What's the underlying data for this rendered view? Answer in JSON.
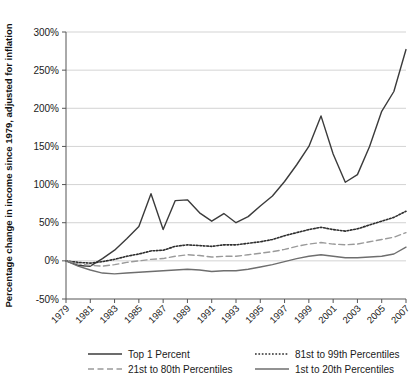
{
  "chart_data": {
    "type": "line",
    "title": "",
    "xlabel": "",
    "ylabel": "Percentage change in income since 1979, adjusted for inflation",
    "grid": true,
    "legend_position": "bottom",
    "ylim": [
      -50,
      300
    ],
    "yticks": [
      "-50%",
      "0%",
      "50%",
      "100%",
      "150%",
      "200%",
      "250%",
      "300%"
    ],
    "ytick_values": [
      -50,
      0,
      50,
      100,
      150,
      200,
      250,
      300
    ],
    "xlim": [
      1979,
      2007
    ],
    "xticks": [
      "1979",
      "1981",
      "1983",
      "1985",
      "1987",
      "1989",
      "1991",
      "1993",
      "1995",
      "1997",
      "1999",
      "2001",
      "2003",
      "2005",
      "2007"
    ],
    "x": [
      1979,
      1980,
      1981,
      1982,
      1983,
      1984,
      1985,
      1986,
      1987,
      1988,
      1989,
      1990,
      1991,
      1992,
      1993,
      1994,
      1995,
      1996,
      1997,
      1998,
      1999,
      2000,
      2001,
      2002,
      2003,
      2004,
      2005,
      2006,
      2007
    ],
    "series": [
      {
        "name": "Top 1 Percent",
        "style": "solid",
        "color": "#3b3b3b",
        "width": 1.4,
        "values": [
          0,
          -6,
          -7,
          3,
          14,
          29,
          45,
          88,
          41,
          79,
          80,
          63,
          52,
          62,
          50,
          58,
          72,
          85,
          104,
          126,
          150,
          190,
          140,
          103,
          113,
          150,
          196,
          222,
          277
        ]
      },
      {
        "name": "81st to 99th Percentiles",
        "style": "dotted",
        "color": "#2e2e2e",
        "width": 1.6,
        "values": [
          0,
          -2,
          -3,
          -1,
          2,
          6,
          9,
          13,
          14,
          19,
          21,
          20,
          19,
          21,
          21,
          23,
          25,
          28,
          33,
          37,
          41,
          44,
          41,
          39,
          42,
          47,
          52,
          57,
          65
        ]
      },
      {
        "name": "21st to 80th Percentiles",
        "style": "dashed",
        "color": "#9a9a9a",
        "width": 1.4,
        "values": [
          0,
          -4,
          -6,
          -7,
          -5,
          -2,
          0,
          2,
          3,
          6,
          8,
          7,
          5,
          6,
          6,
          8,
          10,
          12,
          15,
          19,
          22,
          24,
          22,
          21,
          22,
          25,
          28,
          31,
          37
        ]
      },
      {
        "name": "1st to 20th Percentiles",
        "style": "solid",
        "color": "#6e6e6e",
        "width": 1.4,
        "values": [
          0,
          -7,
          -12,
          -16,
          -17,
          -16,
          -15,
          -14,
          -13,
          -12,
          -11,
          -12,
          -14,
          -13,
          -13,
          -11,
          -8,
          -5,
          -1,
          3,
          6,
          8,
          6,
          4,
          4,
          5,
          6,
          9,
          18
        ]
      }
    ]
  },
  "legend": {
    "items": [
      {
        "label": "Top 1 Percent",
        "style": "solid",
        "color": "#3b3b3b"
      },
      {
        "label": "81st to 99th Percentiles",
        "style": "dotted",
        "color": "#2e2e2e"
      },
      {
        "label": "21st to 80th Percentiles",
        "style": "dashed",
        "color": "#9a9a9a"
      },
      {
        "label": "1st to 20th Percentiles",
        "style": "solid",
        "color": "#6e6e6e"
      }
    ]
  },
  "colors": {
    "grid": "#c8c8c8",
    "axis": "#555555",
    "text": "#1a1a1a",
    "background": "#ffffff"
  }
}
